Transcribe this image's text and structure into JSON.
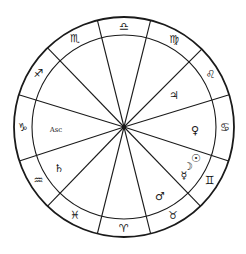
{
  "chart": {
    "center": {
      "x": 124,
      "y": 127
    },
    "outer_radius": 110,
    "inner_radius": 92,
    "line_color": "#1a1a1a",
    "background": "#ffffff"
  },
  "house_cusps_deg": [
    -76,
    -45,
    -17,
    18,
    46,
    76,
    104,
    134,
    162,
    -163,
    -134,
    -104
  ],
  "signs": [
    {
      "name": "Libra",
      "glyph": "♎",
      "angle": -90
    },
    {
      "name": "Virgo",
      "glyph": "♍",
      "angle": -60
    },
    {
      "name": "Leo",
      "glyph": "♌",
      "angle": -31
    },
    {
      "name": "Cancer",
      "glyph": "♋",
      "angle": 0
    },
    {
      "name": "Gemini",
      "glyph": "♊",
      "angle": 32
    },
    {
      "name": "Taurus",
      "glyph": "♉",
      "angle": 61
    },
    {
      "name": "Aries",
      "glyph": "♈",
      "angle": 90
    },
    {
      "name": "Pisces",
      "glyph": "♓",
      "angle": 119
    },
    {
      "name": "Aquarius",
      "glyph": "♒",
      "angle": 148
    },
    {
      "name": "Capricorn",
      "glyph": "♑",
      "angle": 180
    },
    {
      "name": "Sagittarius",
      "glyph": "♐",
      "angle": -148
    },
    {
      "name": "Scorpio",
      "glyph": "♏",
      "angle": -119
    }
  ],
  "planets": [
    {
      "name": "Jupiter",
      "glyph": "♃",
      "x": 174,
      "y": 95
    },
    {
      "name": "Venus",
      "glyph": "♀",
      "x": 195,
      "y": 130
    },
    {
      "name": "Sun",
      "glyph": "☉",
      "x": 196,
      "y": 158
    },
    {
      "name": "Moon",
      "glyph": "☽",
      "x": 188,
      "y": 166
    },
    {
      "name": "Mercury",
      "glyph": "☿",
      "x": 184,
      "y": 175
    },
    {
      "name": "Mars",
      "glyph": "♂",
      "x": 160,
      "y": 196
    },
    {
      "name": "Saturn",
      "glyph": "♄",
      "x": 59,
      "y": 168
    }
  ],
  "angles": [
    {
      "name": "Ascendant",
      "label": "Asc",
      "x": 56,
      "y": 130
    }
  ]
}
